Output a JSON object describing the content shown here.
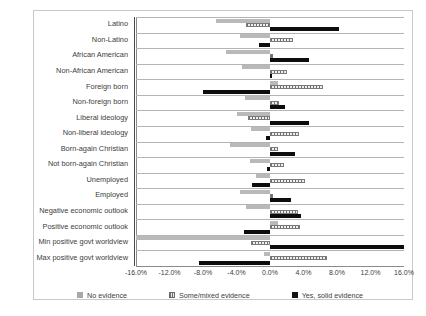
{
  "chart_data": {
    "type": "bar",
    "orientation": "horizontal",
    "title": "",
    "xlabel": "",
    "ylabel": "",
    "xlim": [
      -16.0,
      16.0
    ],
    "xticks": [
      "-16.0%",
      "-12.0%",
      "-8.0%",
      "-4.0%",
      "0.0%",
      "4.0%",
      "8.0%",
      "12.0%",
      "16.0%"
    ],
    "xtick_values": [
      -16,
      -12,
      -8,
      -4,
      0,
      4,
      8,
      12,
      16
    ],
    "grid": false,
    "legend_position": "bottom",
    "categories": [
      "Latino",
      "Non-Latino",
      "African American",
      "Non-African American",
      "Foreign born",
      "Non-foreign born",
      "Liberal ideology",
      "Non-liberal ideology",
      "Born-again Christian",
      "Not born-again Christian",
      "Unemployed",
      "Employed",
      "Negative economic outlook",
      "Positive economic outlook",
      "Min positive govt worldview",
      "Max positive govt worldview"
    ],
    "series": [
      {
        "name": "No evidence",
        "color": "#b9b9b9",
        "values": [
          -6.5,
          -3.6,
          -5.2,
          -3.4,
          1.0,
          -3.0,
          -4.0,
          -2.3,
          -4.8,
          -2.4,
          -1.7,
          -3.6,
          -2.9,
          0.9,
          -16.0,
          -0.7
        ]
      },
      {
        "name": "Some/mixed evidence",
        "color": "#efefef",
        "values": [
          -2.9,
          2.7,
          0.4,
          2.0,
          6.3,
          1.1,
          -2.6,
          3.5,
          1.0,
          1.7,
          4.2,
          0.4,
          3.3,
          3.6,
          -2.3,
          6.8
        ]
      },
      {
        "name": "Yes, solid evidence",
        "color": "#0d0d0d",
        "values": [
          8.2,
          -1.3,
          4.6,
          0.2,
          -8.0,
          1.8,
          4.6,
          -0.5,
          3.0,
          -0.3,
          -2.1,
          2.5,
          3.7,
          -3.1,
          16.0,
          -8.5
        ]
      }
    ]
  },
  "legend": {
    "items": [
      {
        "label": "No evidence",
        "style": "none"
      },
      {
        "label": "Some/mixed evidence",
        "style": "mixed"
      },
      {
        "label": "Yes, solid evidence",
        "style": "solid"
      }
    ]
  }
}
